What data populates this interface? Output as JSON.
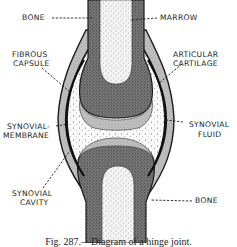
{
  "figure": {
    "title": "Diagram of a hinge joint",
    "caption": "Fig. 287.—Diagram of a hinge joint.",
    "style": "black-and-white stippled anatomical line drawing"
  },
  "labels": {
    "bone_top": "BONE",
    "marrow": "MARROW",
    "fibrous_capsule_1": "FIBROUS",
    "fibrous_capsule_2": "CAPSULE",
    "articular_cartilage_1": "ARTICULAR",
    "articular_cartilage_2": "CARTILAGE",
    "synovial_membrane_1": "SYNOVIAL-",
    "synovial_membrane_2": "MEMBRANE",
    "synovial_fluid_1": "SYNOVIAL",
    "synovial_fluid_2": "FLUID",
    "synovial_cavity_1": "SYNOVIAL",
    "synovial_cavity_2": "CAVITY",
    "bone_bottom": "BONE"
  },
  "colors": {
    "ink": "#1a1a1a",
    "bone_cortex": "#6a6a6a",
    "marrow": "#e6e6e6",
    "cartilage": "#bdbdbd",
    "fluid": "#f2f2f2",
    "background": "#ffffff"
  }
}
